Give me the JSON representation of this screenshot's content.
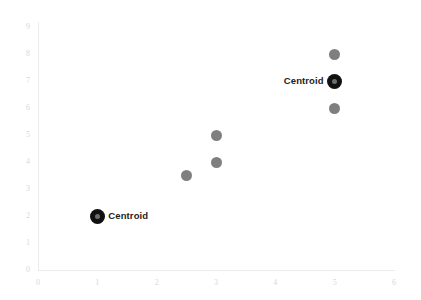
{
  "chart_data": {
    "type": "scatter",
    "title": "",
    "subtitle": "",
    "xlabel": "",
    "ylabel": "",
    "xlim": [
      0,
      6
    ],
    "ylim": [
      0,
      9
    ],
    "xticks": [
      0,
      1,
      2,
      3,
      4,
      5,
      6
    ],
    "yticks": [
      0,
      1,
      2,
      3,
      4,
      5,
      6,
      7,
      8,
      9
    ],
    "xtick_labels": [
      "0",
      "1",
      "2",
      "3",
      "4",
      "5",
      "6"
    ],
    "ytick_labels": [
      "0",
      "1",
      "2",
      "3",
      "4",
      "5",
      "6",
      "7",
      "8",
      "9"
    ],
    "grid": false,
    "legend": false,
    "legend_position": "none",
    "series": [
      {
        "name": "data points",
        "marker": "circle",
        "color": "#7f7f7f",
        "size": 11,
        "points": [
          {
            "x": 2.5,
            "y": 3.5
          },
          {
            "x": 3,
            "y": 5
          },
          {
            "x": 3,
            "y": 4
          },
          {
            "x": 5,
            "y": 8
          },
          {
            "x": 5,
            "y": 6
          }
        ]
      },
      {
        "name": "centroids",
        "marker": "ringed-circle",
        "color": "#111111",
        "inner_color": "#6e6e6e",
        "size": 15,
        "points": [
          {
            "x": 1,
            "y": 2,
            "label": "Centroid",
            "label_side": "right"
          },
          {
            "x": 5,
            "y": 7,
            "label": "Centroid",
            "label_side": "left"
          }
        ]
      }
    ],
    "annotations": [
      {
        "text": "Centroid",
        "x": 1,
        "y": 2,
        "side": "right"
      },
      {
        "text": "Centroid",
        "x": 5,
        "y": 7,
        "side": "left"
      }
    ],
    "colors": {
      "point": "#7f7f7f",
      "centroid": "#111111",
      "centroid_inner": "#6e6e6e",
      "axis": "#ececec",
      "tick_text": "#d8d8d8",
      "label_text": "#1c1c1c",
      "background": "#ffffff"
    }
  }
}
